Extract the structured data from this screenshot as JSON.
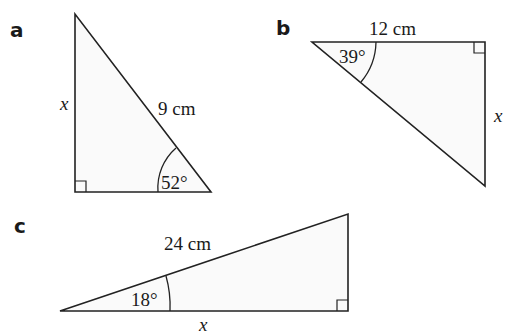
{
  "problems": [
    {
      "label": "a",
      "hypotenuse": "9 cm",
      "angle": "52°",
      "unknown": "x",
      "unknown_side": "opposite (vertical leg)",
      "right_angle": "bottom-left"
    },
    {
      "label": "b",
      "adjacent": "12 cm",
      "angle": "39°",
      "unknown": "x",
      "unknown_side": "opposite (vertical leg)",
      "right_angle": "top-right"
    },
    {
      "label": "c",
      "hypotenuse": "24 cm",
      "angle": "18°",
      "unknown": "x",
      "unknown_side": "adjacent (horizontal leg)",
      "right_angle": "bottom-right"
    }
  ],
  "colors": {
    "stroke": "#222222",
    "fill": "#fafafa",
    "background": "#ffffff"
  }
}
